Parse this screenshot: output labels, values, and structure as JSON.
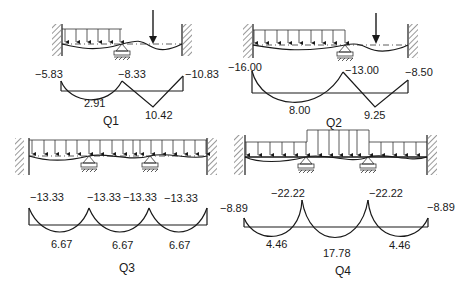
{
  "panels": [
    {
      "id": "Q1",
      "title": "Q1",
      "moment_labels": {
        "left_end": "−5.83",
        "support": "−8.33",
        "right_end": "−10.83",
        "span1_mid": "2.91",
        "span2_point": "10.42"
      }
    },
    {
      "id": "Q2",
      "title": "Q2",
      "moment_labels": {
        "left_end": "−16.00",
        "support": "−13.00",
        "right_end": "−8.50",
        "span1_mid": "8.00",
        "span2_point": "9.25"
      }
    },
    {
      "id": "Q3",
      "title": "Q3",
      "moment_labels": {
        "left_end": "−13.33",
        "support1": "−13.33",
        "support2": "−13.33",
        "right_end": "−13.33",
        "span1_mid": "6.67",
        "span2_mid": "6.67",
        "span3_mid": "6.67"
      }
    },
    {
      "id": "Q4",
      "title": "Q4",
      "moment_labels": {
        "left_end": "−8.89",
        "support1": "−22.22",
        "support2": "−22.22",
        "right_end": "−8.89",
        "span1_mid": "4.46",
        "span2_mid": "17.78",
        "span3_mid": "4.46"
      }
    }
  ],
  "colors": {
    "line": "#1a1a1a",
    "background": "#ffffff"
  }
}
